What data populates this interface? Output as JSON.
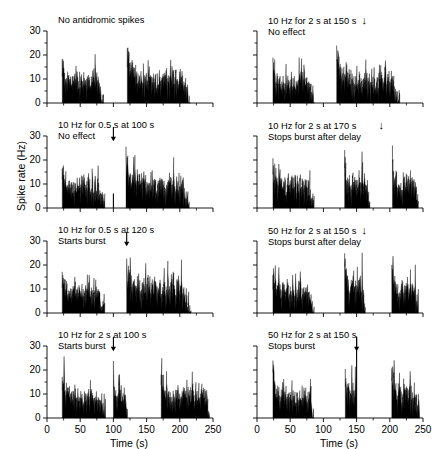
{
  "figure": {
    "axis_label_y": "Spike rate (Hz)",
    "axis_label_x_left": "Time (s)",
    "axis_label_x_right": "Time (s)",
    "ink_color": "#000000",
    "background": "#ffffff"
  },
  "chart_data": {
    "type": "area",
    "title": "",
    "xlabel": "Time (s)",
    "ylabel": "Spike rate (Hz)",
    "xlim": [
      0,
      250
    ],
    "ylim": [
      0,
      30
    ],
    "xticks": [
      0,
      50,
      100,
      150,
      200,
      250
    ],
    "xticklabels": [
      "0",
      "50",
      "100",
      "150",
      "200",
      "250"
    ],
    "xminorticks": [
      25,
      75,
      125,
      175,
      225
    ],
    "yticks": [
      0,
      10,
      20,
      30
    ],
    "yticklabels": [
      "0",
      "10",
      "20",
      "30"
    ],
    "yminorticks": [
      5,
      15,
      25
    ],
    "grid": false,
    "legend": "none",
    "bin_width_s": 1,
    "panels": [
      {
        "id": "panel-1",
        "row": 0,
        "col": 0,
        "annotation_lines": [
          "No antidromic spikes"
        ],
        "stim_arrow_time_s": null,
        "stim_line_time_s": null,
        "bursts": [
          {
            "start_s": 23,
            "end_s": 86,
            "peak_hz": 17.0,
            "mean_hz": 8.2
          },
          {
            "start_s": 121,
            "end_s": 216,
            "peak_hz": 20.2,
            "mean_hz": 9.0
          }
        ]
      },
      {
        "id": "panel-2",
        "row": 0,
        "col": 1,
        "annotation_lines": [
          "10 Hz for 2 s at 150 s",
          "No effect"
        ],
        "stim_arrow_time_s": 150,
        "stim_line_time_s": null,
        "bursts": [
          {
            "start_s": 24,
            "end_s": 86,
            "peak_hz": 16.5,
            "mean_hz": 8.0
          },
          {
            "start_s": 120,
            "end_s": 215,
            "peak_hz": 21.0,
            "mean_hz": 9.2
          }
        ]
      },
      {
        "id": "panel-3",
        "row": 1,
        "col": 0,
        "annotation_lines": [
          "10 Hz for 0.5 s at 100 s",
          "No effect"
        ],
        "stim_arrow_time_s": 100,
        "stim_line_time_s": 100,
        "stim_line_hz": 6.0,
        "bursts": [
          {
            "start_s": 23,
            "end_s": 87,
            "peak_hz": 17.0,
            "mean_hz": 8.4
          },
          {
            "start_s": 119,
            "end_s": 215,
            "peak_hz": 20.0,
            "mean_hz": 9.4
          }
        ]
      },
      {
        "id": "panel-4",
        "row": 1,
        "col": 1,
        "annotation_lines": [
          "10 Hz for 2 s at 170 s",
          "Stops burst after delay"
        ],
        "stim_arrow_time_s": 170,
        "stim_line_time_s": null,
        "bursts": [
          {
            "start_s": 24,
            "end_s": 86,
            "peak_hz": 17.5,
            "mean_hz": 8.6
          },
          {
            "start_s": 132,
            "end_s": 170,
            "peak_hz": 25.0,
            "mean_hz": 9.5
          },
          {
            "start_s": 204,
            "end_s": 243,
            "peak_hz": 21.5,
            "mean_hz": 9.0
          }
        ]
      },
      {
        "id": "panel-5",
        "row": 2,
        "col": 0,
        "annotation_lines": [
          "10 Hz for 0.5 s at 120 s",
          "Starts burst"
        ],
        "stim_arrow_time_s": 120,
        "stim_line_time_s": null,
        "bursts": [
          {
            "start_s": 23,
            "end_s": 87,
            "peak_hz": 17.0,
            "mean_hz": 8.3
          },
          {
            "start_s": 120,
            "end_s": 217,
            "peak_hz": 17.0,
            "mean_hz": 9.6
          }
        ]
      },
      {
        "id": "panel-6",
        "row": 2,
        "col": 1,
        "annotation_lines": [
          "50 Hz for 2 s at 150 s",
          "Stops burst after delay"
        ],
        "stim_arrow_time_s": 150,
        "stim_line_time_s": null,
        "bursts": [
          {
            "start_s": 24,
            "end_s": 86,
            "peak_hz": 17.0,
            "mean_hz": 8.4
          },
          {
            "start_s": 132,
            "end_s": 163,
            "peak_hz": 27.0,
            "mean_hz": 10.5
          },
          {
            "start_s": 203,
            "end_s": 243,
            "peak_hz": 19.0,
            "mean_hz": 9.2
          }
        ]
      },
      {
        "id": "panel-7",
        "row": 3,
        "col": 0,
        "annotation_lines": [
          "10 Hz for 2 s at 100 s",
          "Starts burst"
        ],
        "stim_arrow_time_s": 100,
        "stim_line_time_s": null,
        "bursts": [
          {
            "start_s": 23,
            "end_s": 88,
            "peak_hz": 17.0,
            "mean_hz": 8.2
          },
          {
            "start_s": 100,
            "end_s": 121,
            "peak_hz": 19.0,
            "mean_hz": 8.8
          },
          {
            "start_s": 172,
            "end_s": 245,
            "peak_hz": 17.0,
            "mean_hz": 8.8
          }
        ]
      },
      {
        "id": "panel-8",
        "row": 3,
        "col": 1,
        "annotation_lines": [
          "50 Hz for 2 s at 150 s",
          "Stops burst"
        ],
        "stim_arrow_time_s": 150,
        "stim_line_time_s": 150,
        "stim_line_hz": 34.0,
        "bursts": [
          {
            "start_s": 24,
            "end_s": 86,
            "peak_hz": 17.0,
            "mean_hz": 8.6
          },
          {
            "start_s": 133,
            "end_s": 150,
            "peak_hz": 22.0,
            "mean_hz": 9.8
          },
          {
            "start_s": 203,
            "end_s": 245,
            "peak_hz": 19.5,
            "mean_hz": 9.4
          }
        ]
      }
    ]
  }
}
